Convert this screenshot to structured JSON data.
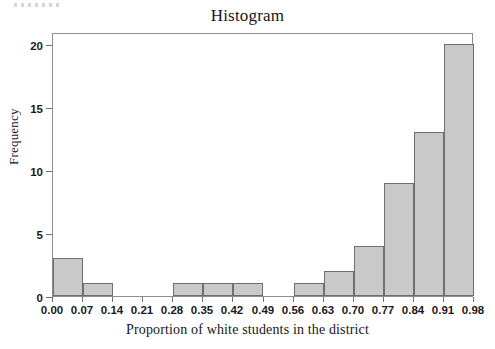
{
  "figure": {
    "title": "Histogram"
  },
  "chart_data": {
    "type": "bar",
    "title": "Histogram",
    "subtitle": "",
    "xlabel": "Proportion of white students in the district",
    "ylabel": "Frequency",
    "xlim": [
      0.0,
      0.98
    ],
    "ylim": [
      0,
      20
    ],
    "grid": false,
    "legend": null,
    "bin_width": 0.07,
    "bin_edges": [
      0.0,
      0.07,
      0.14,
      0.21,
      0.28,
      0.35,
      0.42,
      0.49,
      0.56,
      0.63,
      0.7,
      0.77,
      0.84,
      0.91,
      0.98
    ],
    "categories": [
      "0.00-0.07",
      "0.07-0.14",
      "0.14-0.21",
      "0.21-0.28",
      "0.28-0.35",
      "0.35-0.42",
      "0.42-0.49",
      "0.49-0.56",
      "0.56-0.63",
      "0.63-0.70",
      "0.70-0.77",
      "0.77-0.84",
      "0.84-0.91",
      "0.91-0.98"
    ],
    "values": [
      3,
      1,
      0,
      0,
      1,
      1,
      1,
      0,
      1,
      2,
      4,
      9,
      13,
      20
    ],
    "xticks": [
      "0.00",
      "0.07",
      "0.14",
      "0.21",
      "0.28",
      "0.35",
      "0.42",
      "0.49",
      "0.56",
      "0.63",
      "0.70",
      "0.77",
      "0.84",
      "0.91",
      "0.98"
    ],
    "xtick_values": [
      0.0,
      0.07,
      0.14,
      0.21,
      0.28,
      0.35,
      0.42,
      0.49,
      0.56,
      0.63,
      0.7,
      0.77,
      0.84,
      0.91,
      0.98
    ],
    "yticks": [
      "0",
      "5",
      "10",
      "15",
      "20"
    ],
    "ytick_values": [
      0,
      5,
      10,
      15,
      20
    ],
    "bar_fill_color": "#c9c9c9",
    "bar_edge_color": "#6f6f6f",
    "axis_color": "#8d8d8d",
    "background_color": "#ffffff"
  }
}
